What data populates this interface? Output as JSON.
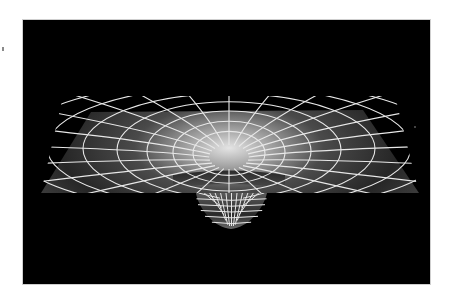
{
  "figure": {
    "colors": {
      "background": "#000000",
      "page": "#ffffff",
      "grid_line": "#e8e8e8",
      "plane_dark": "#1e1e1e",
      "plane_light": "#9a9a9a",
      "throat_glow": "#d8d8d8"
    },
    "geometry": {
      "panel": {
        "x": 22,
        "y": 19,
        "width": 409,
        "height": 266
      },
      "center": {
        "x": 206,
        "y": 131
      },
      "plane_polygon": "68,92 340,90 396,173 18,173",
      "rings": [
        {
          "rx": 36,
          "ry": 22
        },
        {
          "rx": 56,
          "ry": 31
        },
        {
          "rx": 82,
          "ry": 40
        },
        {
          "rx": 112,
          "ry": 48
        },
        {
          "rx": 146,
          "ry": 55
        },
        {
          "rx": 182,
          "ry": 61
        },
        {
          "rx": 218,
          "ry": 66
        }
      ],
      "radial_count": 24,
      "cup": {
        "left": 173,
        "right": 244,
        "top": 173,
        "bottom": 208
      }
    }
  },
  "caption": {
    "text": ""
  }
}
